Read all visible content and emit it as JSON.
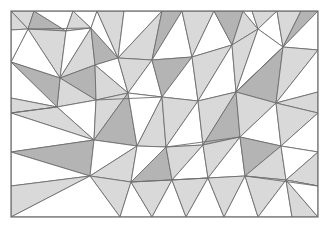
{
  "figure": {
    "type": "geometric-tiling",
    "width": 330,
    "height": 229,
    "background_color": "#ffffff"
  },
  "frame": {
    "name": "outer-border",
    "x": 11,
    "y": 11,
    "width": 307,
    "height": 206,
    "stroke_color": "#6e6e6e",
    "stroke_width": 1.2,
    "fill": "none"
  },
  "palette": {
    "white": "#ffffff",
    "light_gray": "#d9d9d9",
    "mid_gray": "#b4b4b4",
    "stroke": "#6e6e6e",
    "stroke_width": 0.9
  },
  "clip": {
    "x": 11,
    "y": 11,
    "width": 307,
    "height": 206
  },
  "triangles": [
    {
      "id": 1,
      "points": "11,11 34,11 28,29",
      "fill": "light_gray"
    },
    {
      "id": 2,
      "points": "34,11 28,29 66,31",
      "fill": "mid_gray"
    },
    {
      "id": 3,
      "points": "34,11 66,31 73,11",
      "fill": "white"
    },
    {
      "id": 4,
      "points": "66,31 73,11 91,28",
      "fill": "light_gray"
    },
    {
      "id": 5,
      "points": "73,11 91,28 97,11",
      "fill": "white"
    },
    {
      "id": 6,
      "points": "28,29 66,31 60,78",
      "fill": "light_gray"
    },
    {
      "id": 7,
      "points": "28,29 60,78 11,62",
      "fill": "white"
    },
    {
      "id": 8,
      "points": "11,11 28,29 11,30",
      "fill": "light_gray"
    },
    {
      "id": 9,
      "points": "11,30 28,29 11,62",
      "fill": "white"
    },
    {
      "id": 10,
      "points": "66,31 91,28 60,78",
      "fill": "white"
    },
    {
      "id": 11,
      "points": "91,28 60,78 95,65",
      "fill": "light_gray"
    },
    {
      "id": 12,
      "points": "91,28 95,65 118,58",
      "fill": "mid_gray"
    },
    {
      "id": 13,
      "points": "91,28 118,58 97,11",
      "fill": "white"
    },
    {
      "id": 14,
      "points": "97,11 118,58 124,11",
      "fill": "light_gray"
    },
    {
      "id": 15,
      "points": "124,11 118,58 162,11",
      "fill": "white"
    },
    {
      "id": 16,
      "points": "162,11 118,58 152,60",
      "fill": "light_gray"
    },
    {
      "id": 17,
      "points": "162,11 152,60 182,11",
      "fill": "mid_gray"
    },
    {
      "id": 18,
      "points": "182,11 152,60 192,57",
      "fill": "white"
    },
    {
      "id": 19,
      "points": "182,11 192,57 214,11",
      "fill": "light_gray"
    },
    {
      "id": 20,
      "points": "214,11 192,57 232,45",
      "fill": "white"
    },
    {
      "id": 21,
      "points": "214,11 232,45 243,11",
      "fill": "mid_gray"
    },
    {
      "id": 22,
      "points": "243,11 232,45 258,29",
      "fill": "light_gray"
    },
    {
      "id": 23,
      "points": "243,11 258,29 252,11",
      "fill": "white"
    },
    {
      "id": 24,
      "points": "252,11 258,29 277,11",
      "fill": "light_gray"
    },
    {
      "id": 25,
      "points": "277,11 258,29 283,47",
      "fill": "white"
    },
    {
      "id": 26,
      "points": "277,11 283,47 301,11",
      "fill": "light_gray"
    },
    {
      "id": 27,
      "points": "301,11 283,47 318,11",
      "fill": "mid_gray"
    },
    {
      "id": 28,
      "points": "318,11 283,47 318,50",
      "fill": "white"
    },
    {
      "id": 29,
      "points": "60,78 95,65 96,100",
      "fill": "mid_gray"
    },
    {
      "id": 30,
      "points": "60,78 96,100 57,107",
      "fill": "light_gray"
    },
    {
      "id": 31,
      "points": "11,62 60,78 57,107",
      "fill": "mid_gray"
    },
    {
      "id": 32,
      "points": "11,62 57,107 11,98",
      "fill": "white"
    },
    {
      "id": 33,
      "points": "11,98 57,107 11,113",
      "fill": "light_gray"
    },
    {
      "id": 34,
      "points": "95,65 118,58 128,93",
      "fill": "white"
    },
    {
      "id": 35,
      "points": "95,65 128,93 96,100",
      "fill": "light_gray"
    },
    {
      "id": 36,
      "points": "118,58 152,60 128,93",
      "fill": "light_gray"
    },
    {
      "id": 37,
      "points": "152,60 128,93 162,97",
      "fill": "white"
    },
    {
      "id": 38,
      "points": "152,60 162,97 192,57",
      "fill": "mid_gray"
    },
    {
      "id": 39,
      "points": "192,57 162,97 198,101",
      "fill": "white"
    },
    {
      "id": 40,
      "points": "192,57 198,101 232,45",
      "fill": "light_gray"
    },
    {
      "id": 41,
      "points": "232,45 198,101 236,92",
      "fill": "white"
    },
    {
      "id": 42,
      "points": "232,45 236,92 258,29",
      "fill": "light_gray"
    },
    {
      "id": 43,
      "points": "258,29 236,92 283,47",
      "fill": "white"
    },
    {
      "id": 44,
      "points": "283,47 236,92 276,103",
      "fill": "mid_gray"
    },
    {
      "id": 45,
      "points": "283,47 276,103 318,50",
      "fill": "light_gray"
    },
    {
      "id": 46,
      "points": "318,50 276,103 318,92",
      "fill": "white"
    },
    {
      "id": 47,
      "points": "318,92 276,103 318,113",
      "fill": "light_gray"
    },
    {
      "id": 48,
      "points": "57,107 96,100 94,140",
      "fill": "white"
    },
    {
      "id": 49,
      "points": "57,107 94,140 11,113",
      "fill": "light_gray"
    },
    {
      "id": 50,
      "points": "11,113 94,140 11,152",
      "fill": "white"
    },
    {
      "id": 51,
      "points": "96,100 128,93 94,140",
      "fill": "light_gray"
    },
    {
      "id": 52,
      "points": "128,93 94,140 137,146",
      "fill": "mid_gray"
    },
    {
      "id": 53,
      "points": "128,93 137,146 162,97",
      "fill": "white"
    },
    {
      "id": 54,
      "points": "162,97 137,146 166,147",
      "fill": "light_gray"
    },
    {
      "id": 55,
      "points": "162,97 166,147 198,101",
      "fill": "light_gray"
    },
    {
      "id": 56,
      "points": "198,101 166,147 203,145",
      "fill": "white"
    },
    {
      "id": 57,
      "points": "198,101 203,145 236,92",
      "fill": "light_gray"
    },
    {
      "id": 58,
      "points": "236,92 203,145 240,137",
      "fill": "mid_gray"
    },
    {
      "id": 59,
      "points": "236,92 240,137 276,103",
      "fill": "light_gray"
    },
    {
      "id": 60,
      "points": "276,103 240,137 281,146",
      "fill": "white"
    },
    {
      "id": 61,
      "points": "276,103 281,146 318,113",
      "fill": "light_gray"
    },
    {
      "id": 62,
      "points": "318,113 281,146 318,152",
      "fill": "white"
    },
    {
      "id": 63,
      "points": "11,152 94,140 90,176",
      "fill": "mid_gray"
    },
    {
      "id": 64,
      "points": "11,152 90,176 11,186",
      "fill": "white"
    },
    {
      "id": 65,
      "points": "11,186 90,176 11,217",
      "fill": "light_gray"
    },
    {
      "id": 66,
      "points": "94,140 137,146 90,176",
      "fill": "white"
    },
    {
      "id": 67,
      "points": "137,146 90,176 131,182",
      "fill": "light_gray"
    },
    {
      "id": 68,
      "points": "137,146 131,182 166,147",
      "fill": "white"
    },
    {
      "id": 69,
      "points": "166,147 131,182 172,180",
      "fill": "mid_gray"
    },
    {
      "id": 70,
      "points": "166,147 172,180 203,145",
      "fill": "light_gray"
    },
    {
      "id": 71,
      "points": "203,145 172,180 208,178",
      "fill": "white"
    },
    {
      "id": 72,
      "points": "203,145 208,178 240,137",
      "fill": "light_gray"
    },
    {
      "id": 73,
      "points": "240,137 208,178 245,176",
      "fill": "white"
    },
    {
      "id": 74,
      "points": "240,137 245,176 281,146",
      "fill": "mid_gray"
    },
    {
      "id": 75,
      "points": "281,146 245,176 286,180",
      "fill": "light_gray"
    },
    {
      "id": 76,
      "points": "281,146 286,180 318,152",
      "fill": "white"
    },
    {
      "id": 77,
      "points": "318,152 286,180 318,186",
      "fill": "light_gray"
    },
    {
      "id": 78,
      "points": "318,186 286,180 318,217",
      "fill": "white"
    },
    {
      "id": 79,
      "points": "90,176 131,182 120,217",
      "fill": "light_gray"
    },
    {
      "id": 80,
      "points": "90,176 120,217 11,217",
      "fill": "white"
    },
    {
      "id": 81,
      "points": "131,182 120,217 152,217",
      "fill": "white"
    },
    {
      "id": 82,
      "points": "131,182 152,217 172,180",
      "fill": "light_gray"
    },
    {
      "id": 83,
      "points": "172,180 152,217 186,217",
      "fill": "white"
    },
    {
      "id": 84,
      "points": "172,180 186,217 208,178",
      "fill": "light_gray"
    },
    {
      "id": 85,
      "points": "208,178 186,217 224,217",
      "fill": "white"
    },
    {
      "id": 86,
      "points": "208,178 224,217 245,176",
      "fill": "light_gray"
    },
    {
      "id": 87,
      "points": "245,176 224,217 258,217",
      "fill": "white"
    },
    {
      "id": 88,
      "points": "245,176 258,217 286,180",
      "fill": "light_gray"
    },
    {
      "id": 89,
      "points": "286,180 258,217 292,217",
      "fill": "white"
    },
    {
      "id": 90,
      "points": "286,180 292,217 318,217",
      "fill": "light_gray"
    },
    {
      "id": 91,
      "points": "286,180 318,217 318,186",
      "fill": "white"
    }
  ],
  "extra_lines": [
    {
      "name": "edge-seg-top-left",
      "x1": 28,
      "y1": 29,
      "x2": 91,
      "y2": 28
    },
    {
      "name": "edge-seg-mid-left",
      "x1": 11,
      "y1": 113,
      "x2": 57,
      "y2": 107
    },
    {
      "name": "edge-seg-mid-band",
      "x1": 96,
      "y1": 100,
      "x2": 162,
      "y2": 97
    },
    {
      "name": "edge-seg-right-band",
      "x1": 236,
      "y1": 92,
      "x2": 283,
      "y2": 47
    },
    {
      "name": "edge-seg-low-band",
      "x1": 166,
      "y1": 147,
      "x2": 240,
      "y2": 137
    },
    {
      "name": "edge-seg-bottom",
      "x1": 131,
      "y1": 182,
      "x2": 208,
      "y2": 178
    },
    {
      "name": "edge-seg-br",
      "x1": 245,
      "y1": 176,
      "x2": 318,
      "y2": 186
    }
  ]
}
